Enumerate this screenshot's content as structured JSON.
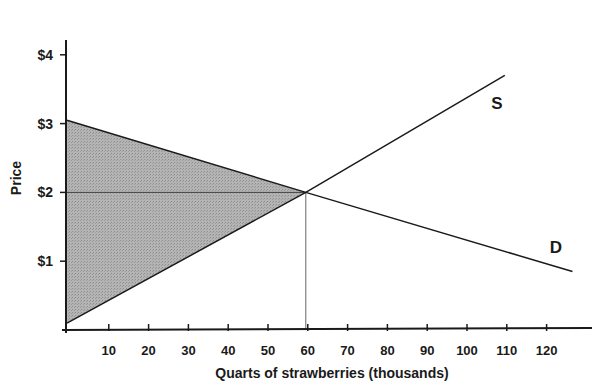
{
  "chart_data": {
    "type": "line",
    "title": "",
    "xlabel": "Quarts of strawberries (thousands)",
    "ylabel": "Price",
    "x_ticks": [
      10,
      20,
      30,
      40,
      50,
      60,
      70,
      80,
      90,
      100,
      110,
      120
    ],
    "y_ticks": [
      "$1",
      "$2",
      "$3",
      "$4"
    ],
    "y_tick_values": [
      1,
      2,
      3,
      4
    ],
    "xlim": [
      0,
      130
    ],
    "ylim": [
      0,
      4.3
    ],
    "grid": false,
    "series": [
      {
        "name": "S",
        "label": "S",
        "points": [
          [
            0,
            0.1
          ],
          [
            60,
            2.0
          ],
          [
            110,
            3.7
          ]
        ]
      },
      {
        "name": "D",
        "label": "D",
        "points": [
          [
            0,
            3.05
          ],
          [
            60,
            2.0
          ],
          [
            127,
            0.85
          ]
        ]
      }
    ],
    "equilibrium": {
      "quantity": 60,
      "price": 2
    },
    "shaded_region": {
      "description": "Total surplus (consumer + producer)",
      "vertices": [
        [
          0,
          3.05
        ],
        [
          60,
          2.0
        ],
        [
          0,
          0.1
        ]
      ],
      "color": "#a8a8a8"
    },
    "reference_lines": [
      {
        "type": "horizontal",
        "y": 2,
        "from_x": 0,
        "to_x": 60
      },
      {
        "type": "vertical",
        "x": 60,
        "from_y": 0,
        "to_y": 2
      }
    ]
  }
}
